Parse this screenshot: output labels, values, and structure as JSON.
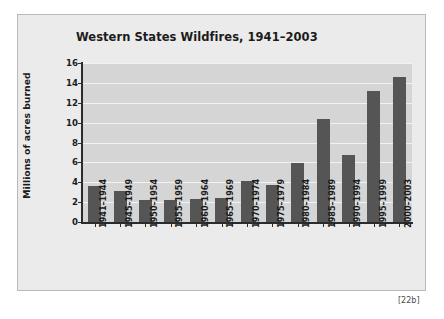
{
  "caption": "[22b]",
  "chart_data": {
    "type": "bar",
    "title": "Western States Wildfires, 1941–2003",
    "xlabel": "",
    "ylabel": "Millions of acres burned",
    "ylim": [
      0,
      16
    ],
    "ytick_values": [
      0,
      2,
      4,
      6,
      8,
      10,
      12,
      14,
      16
    ],
    "ytick_labels": [
      "0",
      "2",
      "4",
      "6",
      "8",
      "10",
      "12",
      "14",
      "16"
    ],
    "grid": true,
    "legend": "none",
    "bar_color": "#555555",
    "plot_background": "#d5d5d5",
    "gridline_color": "#f2f2f2",
    "page_background": "#ebebeb",
    "categories": [
      "1941–1944",
      "1945–1949",
      "1950–1954",
      "1955–1959",
      "1960–1964",
      "1965–1969",
      "1970–1974",
      "1975–1979",
      "1980–1984",
      "1985–1989",
      "1990–1994",
      "1995–1999",
      "2000–2003"
    ],
    "values": [
      3.6,
      3.1,
      2.25,
      2.25,
      2.3,
      2.4,
      4.15,
      3.75,
      5.95,
      10.4,
      6.7,
      13.2,
      14.6
    ]
  }
}
